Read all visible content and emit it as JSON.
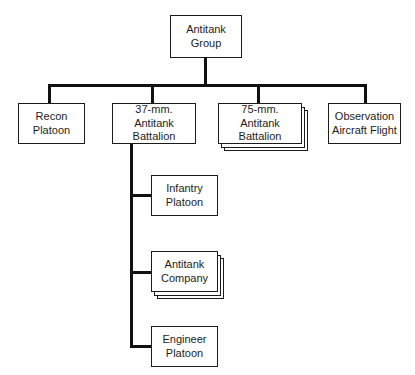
{
  "diagram": {
    "type": "org-chart",
    "line_color": "#111111",
    "box_border_color": "#1b1b1b",
    "box_fill_color": "#ffffff",
    "text_color": "#1d1d1d",
    "background_color": "#fefefe"
  },
  "root": {
    "label": "Antitank\nGroup",
    "line1": "Antitank",
    "line2": "Group"
  },
  "level1": [
    {
      "id": "recon-platoon",
      "label": "Recon\nPlatoon",
      "line1": "Recon",
      "line2": "Platoon",
      "stack_count": 1
    },
    {
      "id": "37mm-antitank-battalion",
      "label": "37-mm. Antitank\nBattalion",
      "line1": "37-mm. Antitank",
      "line2": "Battalion",
      "stack_count": 1
    },
    {
      "id": "75mm-antitank-battalion",
      "label": "75-mm. Antitank\nBattalion",
      "line1": "75-mm. Antitank",
      "line2": "Battalion",
      "stack_count": 3
    },
    {
      "id": "observation-aircraft-flight",
      "label": "Observation\nAircraft Flight",
      "line1": "Observation",
      "line2": "Aircraft Flight",
      "stack_count": 1
    }
  ],
  "level2": [
    {
      "id": "infantry-platoon",
      "label": "Infantry\nPlatoon",
      "line1": "Infantry",
      "line2": "Platoon",
      "stack_count": 1,
      "parent": "37mm-antitank-battalion"
    },
    {
      "id": "antitank-company",
      "label": "Antitank\nCompany",
      "line1": "Antitank",
      "line2": "Company",
      "stack_count": 3,
      "parent": "37mm-antitank-battalion"
    },
    {
      "id": "engineer-platoon",
      "label": "Engineer\nPlatoon",
      "line1": "Engineer",
      "line2": "Platoon",
      "stack_count": 1,
      "parent": "37mm-antitank-battalion"
    }
  ]
}
